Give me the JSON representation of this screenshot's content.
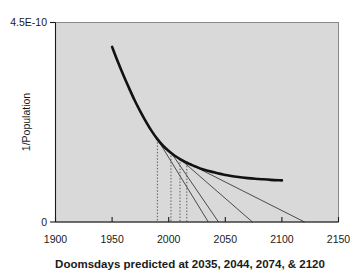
{
  "chart_data": {
    "type": "line",
    "title": "",
    "xlabel": "Doomsdays predicted at 2035, 2044, 2074, & 2120",
    "ylabel": "1/Population",
    "xlim": [
      1900,
      2150
    ],
    "ylim": [
      0,
      4.5e-10
    ],
    "grid": false,
    "legend": "none",
    "x_ticks": [
      "1900",
      "1950",
      "2000",
      "2050",
      "2100",
      "2150"
    ],
    "x_tick_values": [
      1900,
      1950,
      2000,
      2050,
      2100,
      2150
    ],
    "y_ticks": [
      "0",
      "4.5E-10"
    ],
    "y_tick_values": [
      0,
      4.5e-10
    ],
    "y_axis_top_label": "4.5E-10",
    "y_axis_bottom_label": "0",
    "series": [
      {
        "name": "1/Population",
        "type": "line",
        "style": "thick-solid-black",
        "x": [
          1950,
          1955,
          1960,
          1965,
          1970,
          1975,
          1980,
          1985,
          1990,
          1995,
          2000,
          2005,
          2010,
          2015,
          2020,
          2030,
          2040,
          2050,
          2060,
          2070,
          2080,
          2090,
          2100
        ],
        "y": [
          3.95e-10,
          3.62e-10,
          3.31e-10,
          3.02e-10,
          2.74e-10,
          2.49e-10,
          2.26e-10,
          2.05e-10,
          1.87e-10,
          1.72e-10,
          1.6e-10,
          1.5e-10,
          1.42e-10,
          1.35e-10,
          1.29e-10,
          1.19e-10,
          1.12e-10,
          1.06e-10,
          1.02e-10,
          9.9e-11,
          9.7e-11,
          9.5e-11,
          9.4e-11
        ]
      },
      {
        "name": "Tangent at 1990 (doomsday 2035)",
        "type": "tangent",
        "style": "thin-solid-gray",
        "tangent_year": 1990,
        "tangent_value": 1.87e-10,
        "doomsday_year": 2035
      },
      {
        "name": "Tangent at 2002 (doomsday 2044)",
        "type": "tangent",
        "style": "thin-solid-gray",
        "tangent_year": 2002,
        "tangent_value": 1.57e-10,
        "doomsday_year": 2044
      },
      {
        "name": "Tangent at 2010 (doomsday 2074)",
        "type": "tangent",
        "style": "thin-solid-gray",
        "tangent_year": 2010,
        "tangent_value": 1.42e-10,
        "doomsday_year": 2074
      },
      {
        "name": "Tangent at 2016 (doomsday 2120)",
        "type": "tangent",
        "style": "thin-solid-gray",
        "tangent_year": 2016,
        "tangent_value": 1.34e-10,
        "doomsday_year": 2120
      }
    ],
    "drop_lines": [
      {
        "year": 1990,
        "from_value": 1.87e-10,
        "to_value": 0,
        "style": "dotted"
      },
      {
        "year": 2002,
        "from_value": 1.57e-10,
        "to_value": 0,
        "style": "dotted"
      },
      {
        "year": 2010,
        "from_value": 1.42e-10,
        "to_value": 0,
        "style": "dotted"
      },
      {
        "year": 2016,
        "from_value": 1.34e-10,
        "to_value": 0,
        "style": "dotted"
      }
    ],
    "doomsdays": [
      2035,
      2044,
      2074,
      2120
    ],
    "annotations": []
  },
  "colors": {
    "plot_background": "#d9d9d9",
    "page_background": "#ffffff",
    "curve": "#111111",
    "tangent": "#3a3a3a",
    "dropline": "#4a4a4a",
    "axis": "#1a1a1a",
    "text": "#1a1a1a"
  },
  "labels": {
    "y_top": "4.5E-10",
    "y_bottom": "0",
    "y_axis_title": "1/Population",
    "x_axis_title": "Doomsdays predicted at 2035, 2044, 2074, & 2120",
    "x_tick_1": "1900",
    "x_tick_2": "1950",
    "x_tick_3": "2000",
    "x_tick_4": "2050",
    "x_tick_5": "2100",
    "x_tick_6": "2150"
  }
}
